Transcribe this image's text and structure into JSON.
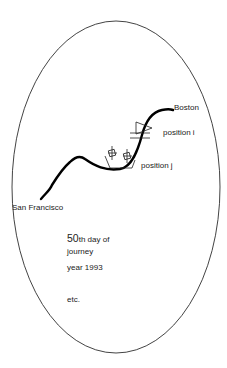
{
  "diagram": {
    "cities": {
      "start": "San Francisco",
      "end": "Boston"
    },
    "positions": {
      "i": "position i",
      "j": "position j"
    },
    "notes": {
      "day_number": "50",
      "day_suffix": "th day of",
      "line2": "journey",
      "line3": "year 1993",
      "line4": "etc."
    },
    "colors": {
      "stroke": "#000000",
      "text": "#222222",
      "background": "#ffffff"
    }
  }
}
